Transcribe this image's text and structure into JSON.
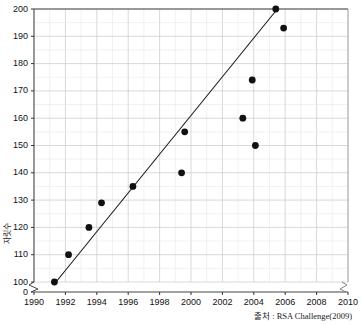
{
  "chart_data": {
    "type": "scatter",
    "title": "",
    "xlabel": "",
    "ylabel": "자릿수",
    "xlim": [
      1990,
      2010
    ],
    "ylim": [
      100,
      200
    ],
    "y_axis_break": true,
    "y_break_value": 0,
    "grid": true,
    "legend": "none",
    "xticks": [
      "1990",
      "1992",
      "1994",
      "1996",
      "1998",
      "2000",
      "2002",
      "2004",
      "2006",
      "2008",
      "2010"
    ],
    "yticks": [
      "200",
      "190",
      "180",
      "170",
      "160",
      "150",
      "140",
      "130",
      "120",
      "110",
      "100",
      "0"
    ],
    "points": [
      {
        "x": 1991.3,
        "y": 100
      },
      {
        "x": 1992.2,
        "y": 110
      },
      {
        "x": 1993.5,
        "y": 120
      },
      {
        "x": 1994.3,
        "y": 129
      },
      {
        "x": 1996.3,
        "y": 135
      },
      {
        "x": 1999.4,
        "y": 140
      },
      {
        "x": 1999.6,
        "y": 155
      },
      {
        "x": 2003.3,
        "y": 160
      },
      {
        "x": 2003.9,
        "y": 174
      },
      {
        "x": 2004.1,
        "y": 150
      },
      {
        "x": 2005.4,
        "y": 200
      },
      {
        "x": 2005.9,
        "y": 193
      }
    ],
    "trendline": {
      "x1": 1991.4,
      "y1": 100,
      "x2": 2005.5,
      "y2": 200
    },
    "annotations": [],
    "source": "출처 : RSA Challenge(2009)"
  },
  "axis": {
    "ylabel_text": "자릿수"
  }
}
